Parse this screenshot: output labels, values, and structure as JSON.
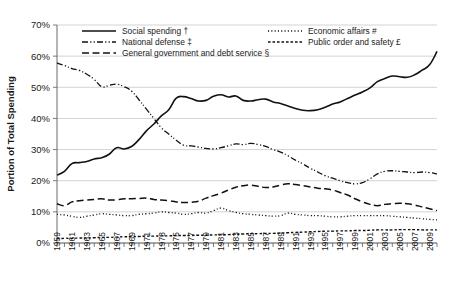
{
  "chart_data": {
    "type": "line",
    "title": "",
    "xlabel": "",
    "ylabel": "Portion of Total Spending",
    "ylim": [
      0,
      70
    ],
    "yunit": "%",
    "ytick_labels": [
      "0%",
      "10%",
      "20%",
      "30%",
      "40%",
      "50%",
      "60%",
      "70%"
    ],
    "ytick_values": [
      0,
      10,
      20,
      30,
      40,
      50,
      60,
      70
    ],
    "grid": true,
    "legend_position": "top-inside",
    "xlim": [
      1959,
      2010
    ],
    "x": [
      1959,
      1960,
      1961,
      1962,
      1963,
      1964,
      1965,
      1966,
      1967,
      1968,
      1969,
      1970,
      1971,
      1972,
      1973,
      1974,
      1975,
      1976,
      1977,
      1978,
      1979,
      1980,
      1981,
      1982,
      1983,
      1984,
      1985,
      1986,
      1987,
      1988,
      1989,
      1990,
      1991,
      1992,
      1993,
      1994,
      1995,
      1996,
      1997,
      1998,
      1999,
      2000,
      2001,
      2002,
      2003,
      2004,
      2005,
      2006,
      2007,
      2008,
      2009,
      2010
    ],
    "xtick_labels": [
      "1959",
      "1961",
      "1963",
      "1965",
      "1967",
      "1969",
      "1971",
      "1973",
      "1975",
      "1977",
      "1979",
      "1981",
      "1983",
      "1985",
      "1987",
      "1989",
      "1991",
      "1993",
      "1995",
      "1997",
      "1999",
      "2001",
      "2003",
      "2005",
      "2007",
      "2009"
    ],
    "series": [
      {
        "name": "Social spending †",
        "style": "solid",
        "color": "#111111",
        "width": 1.6,
        "values": [
          21.8,
          23.0,
          25.5,
          25.8,
          26.2,
          27.0,
          27.4,
          28.5,
          30.6,
          30.2,
          31.0,
          33.2,
          36.0,
          38.2,
          40.8,
          42.8,
          46.5,
          47.0,
          46.4,
          45.6,
          45.8,
          47.1,
          47.6,
          46.9,
          47.2,
          45.8,
          45.6,
          46.0,
          46.2,
          45.3,
          44.8,
          44.0,
          43.2,
          42.6,
          42.5,
          42.8,
          43.6,
          44.6,
          45.3,
          46.4,
          47.5,
          48.5,
          49.8,
          51.8,
          52.8,
          53.6,
          53.4,
          53.2,
          54.0,
          55.5,
          57.2,
          61.5
        ]
      },
      {
        "name": "National defense ‡",
        "style": "dashdotdot",
        "color": "#111111",
        "width": 1.3,
        "values": [
          57.8,
          57.0,
          56.0,
          55.4,
          54.2,
          52.5,
          50.2,
          50.6,
          51.0,
          50.2,
          48.8,
          46.0,
          43.0,
          40.0,
          37.0,
          35.0,
          33.0,
          31.4,
          31.2,
          30.8,
          30.4,
          30.2,
          30.6,
          31.2,
          31.8,
          31.6,
          32.0,
          31.6,
          31.0,
          30.0,
          29.2,
          28.0,
          26.6,
          25.4,
          24.0,
          22.8,
          21.6,
          20.8,
          20.0,
          19.4,
          19.0,
          19.4,
          20.6,
          22.2,
          23.0,
          23.2,
          23.0,
          22.8,
          22.6,
          22.8,
          22.6,
          22.2
        ]
      },
      {
        "name": "General government and debt service §",
        "style": "dashed",
        "color": "#111111",
        "width": 1.5,
        "values": [
          12.6,
          12.0,
          13.2,
          13.6,
          13.8,
          14.0,
          14.2,
          13.8,
          13.9,
          14.2,
          14.2,
          14.3,
          14.4,
          14.0,
          13.8,
          13.6,
          13.2,
          13.0,
          13.1,
          13.4,
          14.4,
          15.2,
          16.0,
          17.0,
          17.9,
          18.4,
          18.6,
          18.2,
          17.8,
          18.0,
          18.6,
          19.0,
          18.8,
          18.4,
          18.0,
          17.6,
          17.4,
          17.0,
          16.2,
          15.4,
          14.2,
          13.2,
          12.4,
          12.0,
          12.4,
          12.6,
          12.8,
          12.6,
          12.2,
          11.6,
          11.0,
          10.4
        ]
      },
      {
        "name": "Economic affairs #",
        "style": "dotted",
        "color": "#111111",
        "width": 1.3,
        "values": [
          9.2,
          9.0,
          8.6,
          8.2,
          8.6,
          9.0,
          9.4,
          9.2,
          9.0,
          8.8,
          8.8,
          9.2,
          9.4,
          9.6,
          10.0,
          9.8,
          9.6,
          9.2,
          9.4,
          9.8,
          9.6,
          10.4,
          11.2,
          10.4,
          9.8,
          9.4,
          9.2,
          9.0,
          8.8,
          8.6,
          8.8,
          9.6,
          9.2,
          9.0,
          8.8,
          8.8,
          8.6,
          8.4,
          8.4,
          8.6,
          8.8,
          8.8,
          8.8,
          8.8,
          8.8,
          8.6,
          8.4,
          8.2,
          8.0,
          7.8,
          7.6,
          7.4
        ]
      },
      {
        "name": "Public order and safety £",
        "style": "finedash",
        "color": "#111111",
        "width": 1.4,
        "values": [
          1.4,
          1.5,
          1.5,
          1.6,
          1.6,
          1.7,
          1.8,
          1.8,
          1.9,
          2.0,
          2.0,
          2.1,
          2.2,
          2.2,
          2.3,
          2.3,
          2.4,
          2.4,
          2.4,
          2.5,
          2.5,
          2.6,
          2.6,
          2.7,
          2.8,
          2.9,
          3.0,
          3.0,
          3.1,
          3.1,
          3.2,
          3.3,
          3.4,
          3.5,
          3.6,
          3.7,
          3.8,
          3.8,
          3.9,
          3.9,
          4.0,
          4.0,
          4.1,
          4.2,
          4.2,
          4.2,
          4.3,
          4.3,
          4.3,
          4.2,
          4.2,
          4.2
        ]
      }
    ],
    "legend": [
      {
        "label": "Social spending †",
        "style": "solid",
        "column": 0
      },
      {
        "label": "National defense ‡",
        "style": "dashdotdot",
        "column": 0
      },
      {
        "label": "General government and debt service §",
        "style": "dashed",
        "column": 0
      },
      {
        "label": "Economic affairs #",
        "style": "dotted",
        "column": 1
      },
      {
        "label": "Public order and safety £",
        "style": "finedash",
        "column": 1
      }
    ]
  }
}
